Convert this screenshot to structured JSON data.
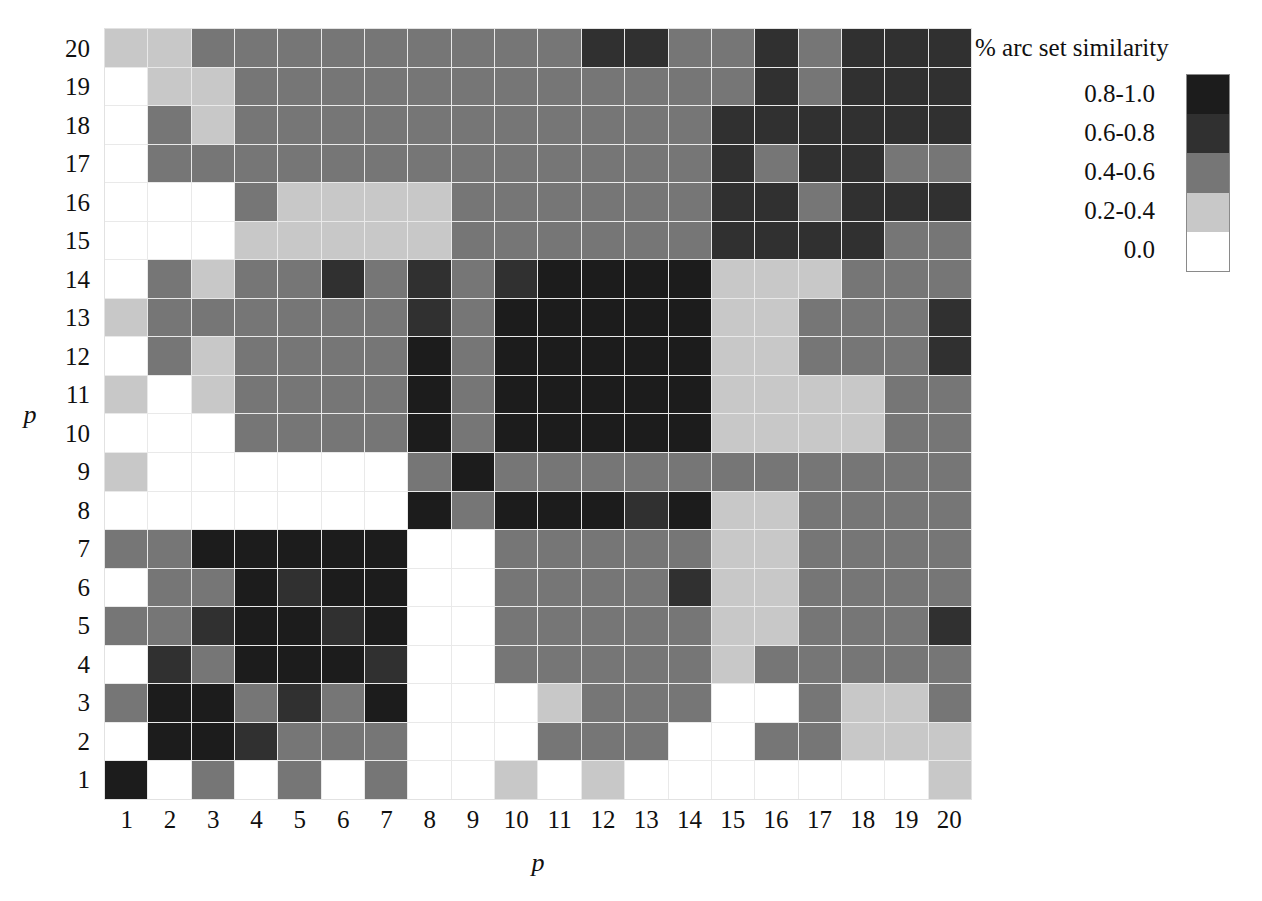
{
  "legend": {
    "title": "% arc set similarity",
    "entries": [
      {
        "label": "0.8-1.0",
        "color": "#1c1c1c"
      },
      {
        "label": "0.6-0.8",
        "color": "#303030"
      },
      {
        "label": "0.4-0.6",
        "color": "#767676"
      },
      {
        "label": "0.2-0.4",
        "color": "#c8c8c8"
      },
      {
        "label": "0.0",
        "color": "#ffffff"
      }
    ]
  },
  "axes": {
    "x_title": "p",
    "y_title": "p",
    "x_ticks": [
      "1",
      "2",
      "3",
      "4",
      "5",
      "6",
      "7",
      "8",
      "9",
      "10",
      "11",
      "12",
      "13",
      "14",
      "15",
      "16",
      "17",
      "18",
      "19",
      "20"
    ],
    "y_ticks": [
      "20",
      "19",
      "18",
      "17",
      "16",
      "15",
      "14",
      "13",
      "12",
      "11",
      "10",
      "9",
      "8",
      "7",
      "6",
      "5",
      "4",
      "3",
      "2",
      "1"
    ]
  },
  "chart_data": {
    "type": "heatmap",
    "title": "% arc set similarity",
    "xlabel": "p",
    "ylabel": "p",
    "grid": true,
    "legend_position": "right",
    "x": [
      "1",
      "2",
      "3",
      "4",
      "5",
      "6",
      "7",
      "8",
      "9",
      "10",
      "11",
      "12",
      "13",
      "14",
      "15",
      "16",
      "17",
      "18",
      "19",
      "20"
    ],
    "y_top_to_bottom": [
      "20",
      "19",
      "18",
      "17",
      "16",
      "15",
      "14",
      "13",
      "12",
      "11",
      "10",
      "9",
      "8",
      "7",
      "6",
      "5",
      "4",
      "3",
      "2",
      "1"
    ],
    "bin_edges": [
      0.0,
      0.2,
      0.4,
      0.6,
      0.8,
      1.0
    ],
    "bin_labels": [
      "0.0",
      "0.2-0.4",
      "0.4-0.6",
      "0.6-0.8",
      "0.8-1.0"
    ],
    "bin_colors": [
      "#ffffff",
      "#c8c8c8",
      "#767676",
      "#303030",
      "#1c1c1c"
    ],
    "values_note": "Each entry is a bin index 0-4 mapping into bin_colors/bin_labels. Rows listed top (p=20) to bottom (p=1); columns left (p=1) to right (p=20).",
    "rows": [
      {
        "row_label": "20",
        "bins": [
          1,
          1,
          2,
          2,
          2,
          2,
          2,
          2,
          2,
          2,
          2,
          3,
          3,
          2,
          2,
          3,
          2,
          3,
          3,
          3
        ]
      },
      {
        "row_label": "19",
        "bins": [
          0,
          1,
          1,
          2,
          2,
          2,
          2,
          2,
          2,
          2,
          2,
          2,
          2,
          2,
          2,
          3,
          2,
          3,
          3,
          3
        ]
      },
      {
        "row_label": "18",
        "bins": [
          0,
          2,
          1,
          2,
          2,
          2,
          2,
          2,
          2,
          2,
          2,
          2,
          2,
          2,
          3,
          3,
          3,
          3,
          3,
          3
        ]
      },
      {
        "row_label": "17",
        "bins": [
          0,
          2,
          2,
          2,
          2,
          2,
          2,
          2,
          2,
          2,
          2,
          2,
          2,
          2,
          3,
          2,
          3,
          3,
          2,
          2
        ]
      },
      {
        "row_label": "16",
        "bins": [
          0,
          0,
          0,
          2,
          1,
          1,
          1,
          1,
          2,
          2,
          2,
          2,
          2,
          2,
          3,
          3,
          2,
          3,
          3,
          3
        ]
      },
      {
        "row_label": "15",
        "bins": [
          0,
          0,
          0,
          1,
          1,
          1,
          1,
          1,
          2,
          2,
          2,
          2,
          2,
          2,
          3,
          3,
          3,
          3,
          2,
          2
        ]
      },
      {
        "row_label": "14",
        "bins": [
          0,
          2,
          1,
          2,
          2,
          3,
          2,
          3,
          2,
          3,
          4,
          4,
          4,
          4,
          1,
          1,
          1,
          2,
          2,
          2
        ]
      },
      {
        "row_label": "13",
        "bins": [
          1,
          2,
          2,
          2,
          2,
          2,
          2,
          3,
          2,
          4,
          4,
          4,
          4,
          4,
          1,
          1,
          2,
          2,
          2,
          3
        ]
      },
      {
        "row_label": "12",
        "bins": [
          0,
          2,
          1,
          2,
          2,
          2,
          2,
          4,
          2,
          4,
          4,
          4,
          4,
          4,
          1,
          1,
          2,
          2,
          2,
          3
        ]
      },
      {
        "row_label": "11",
        "bins": [
          1,
          0,
          1,
          2,
          2,
          2,
          2,
          4,
          2,
          4,
          4,
          4,
          4,
          4,
          1,
          1,
          1,
          1,
          2,
          2
        ]
      },
      {
        "row_label": "10",
        "bins": [
          0,
          0,
          0,
          2,
          2,
          2,
          2,
          4,
          2,
          4,
          4,
          4,
          4,
          4,
          1,
          1,
          1,
          1,
          2,
          2
        ]
      },
      {
        "row_label": "9",
        "bins": [
          1,
          0,
          0,
          0,
          0,
          0,
          0,
          2,
          4,
          2,
          2,
          2,
          2,
          2,
          2,
          2,
          2,
          2,
          2,
          2
        ]
      },
      {
        "row_label": "8",
        "bins": [
          0,
          0,
          0,
          0,
          0,
          0,
          0,
          4,
          2,
          4,
          4,
          4,
          3,
          4,
          1,
          1,
          2,
          2,
          2,
          2
        ]
      },
      {
        "row_label": "7",
        "bins": [
          2,
          2,
          4,
          4,
          4,
          4,
          4,
          0,
          0,
          2,
          2,
          2,
          2,
          2,
          1,
          1,
          2,
          2,
          2,
          2
        ]
      },
      {
        "row_label": "6",
        "bins": [
          0,
          2,
          2,
          4,
          3,
          4,
          4,
          0,
          0,
          2,
          2,
          2,
          2,
          3,
          1,
          1,
          2,
          2,
          2,
          2
        ]
      },
      {
        "row_label": "5",
        "bins": [
          2,
          2,
          3,
          4,
          4,
          3,
          4,
          0,
          0,
          2,
          2,
          2,
          2,
          2,
          1,
          1,
          2,
          2,
          2,
          3
        ]
      },
      {
        "row_label": "4",
        "bins": [
          0,
          3,
          2,
          4,
          4,
          4,
          3,
          0,
          0,
          2,
          2,
          2,
          2,
          2,
          1,
          2,
          2,
          2,
          2,
          2
        ]
      },
      {
        "row_label": "3",
        "bins": [
          2,
          4,
          4,
          2,
          3,
          2,
          4,
          0,
          0,
          0,
          1,
          2,
          2,
          2,
          0,
          0,
          2,
          1,
          1,
          2
        ]
      },
      {
        "row_label": "2",
        "bins": [
          0,
          4,
          4,
          3,
          2,
          2,
          2,
          0,
          0,
          0,
          2,
          2,
          2,
          0,
          0,
          2,
          2,
          1,
          1,
          1
        ]
      },
      {
        "row_label": "1",
        "bins": [
          4,
          0,
          2,
          0,
          2,
          0,
          2,
          0,
          0,
          1,
          0,
          1,
          0,
          0,
          0,
          0,
          0,
          0,
          0,
          1
        ]
      }
    ]
  }
}
